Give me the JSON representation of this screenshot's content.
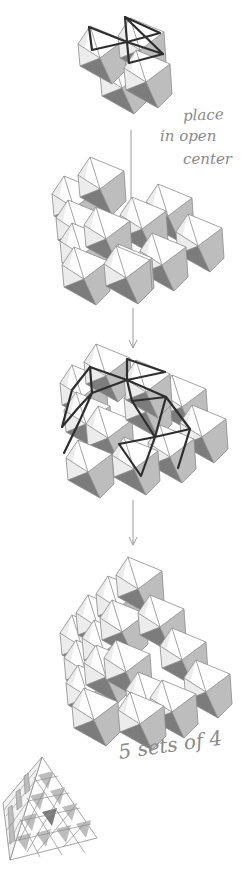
{
  "diagram": {
    "type": "assembly-instructions",
    "steps": [
      {
        "id": "step-1",
        "description": "unit of 4 octahedra with highlighted top edges"
      },
      {
        "id": "step-2",
        "description": "arrangement of octahedra with open center"
      },
      {
        "id": "step-3",
        "description": "unit placed into center, edges highlighted"
      },
      {
        "id": "step-4",
        "description": "completed stack of octahedra"
      },
      {
        "id": "step-5",
        "description": "finished tetrahedral pyramid"
      }
    ],
    "annotations": {
      "place_line1": "place",
      "place_line2": "in open",
      "place_line3": "center",
      "sets": "5 sets of 4"
    },
    "colors": {
      "background": "#ffffff",
      "face_dark": "#7c7c7c",
      "face_light": "#bdbdbd",
      "face_sliver": "#ececec",
      "edge_thin": "#8c8c8c",
      "edge_bold": "#2e2e2e",
      "annotation": "#8a8a8a"
    }
  }
}
